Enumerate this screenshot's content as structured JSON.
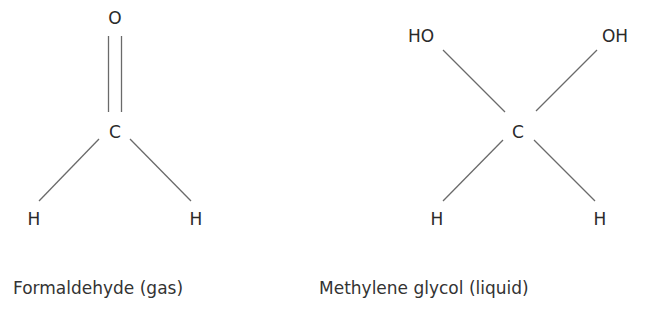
{
  "formaldehyde": {
    "caption": "Formaldehyde (gas)",
    "atoms": {
      "top": "O",
      "center": "C",
      "bottom_left": "H",
      "bottom_right": "H"
    }
  },
  "methylene_glycol": {
    "caption": "Methylene glycol (liquid)",
    "atoms": {
      "top_left": "HO",
      "top_right": "OH",
      "center": "C",
      "bottom_left": "H",
      "bottom_right": "H"
    }
  },
  "colors": {
    "bond": "#6a6a6a",
    "text": "#2a2a2a"
  }
}
